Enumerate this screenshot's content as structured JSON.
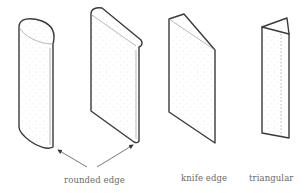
{
  "figure": {
    "shapes": [
      {
        "id": "rounded-cylinder",
        "type": "rounded edge"
      },
      {
        "id": "rounded-slab",
        "type": "rounded edge"
      },
      {
        "id": "knife-edge-blade",
        "type": "knife edge"
      },
      {
        "id": "triangular-prism",
        "type": "triangular"
      }
    ],
    "labels": {
      "rounded": "rounded edge",
      "knife": "knife edge",
      "triangular": "triangular"
    },
    "colors": {
      "outline": "#3a3a3a",
      "text": "#6a6a6a",
      "stipple": "#c8c8c8",
      "background": "#ffffff"
    }
  }
}
